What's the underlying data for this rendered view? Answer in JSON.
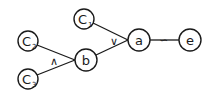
{
  "diagram": {
    "type": "logic-tree",
    "nodes": {
      "c1": {
        "label": "C",
        "subscript": "1"
      },
      "c2": {
        "label": "C",
        "subscript": "2"
      },
      "c3": {
        "label": "C",
        "subscript": "3"
      },
      "b": {
        "label": "b"
      },
      "a": {
        "label": "a"
      },
      "e": {
        "label": "e"
      }
    },
    "operators": {
      "and": "∧",
      "or": "∨",
      "tilde": "∽"
    },
    "edges": [
      {
        "from": "C2",
        "to": "b",
        "operator": "∧"
      },
      {
        "from": "C3",
        "to": "b",
        "operator": "∧"
      },
      {
        "from": "C1",
        "to": "a",
        "operator": "∨"
      },
      {
        "from": "b",
        "to": "a",
        "operator": "∨"
      },
      {
        "from": "a",
        "to": "e",
        "operator": "∽"
      }
    ]
  }
}
